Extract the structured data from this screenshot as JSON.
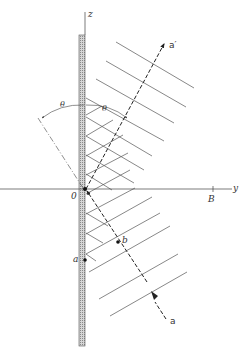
{
  "figure": {
    "type": "physics-diagram",
    "colors": {
      "ink": "#333333",
      "paper": "#ffffff",
      "slab_fill": "#bdbdbd"
    }
  },
  "labels": {
    "z_axis": "z",
    "y_axis": "y",
    "origin": "0",
    "point_B": "B",
    "point_a": "a",
    "point_b": "b",
    "ray_incident": "a",
    "ray_reflected": "a′",
    "angle_left": "θ",
    "angle_right": "θ"
  }
}
